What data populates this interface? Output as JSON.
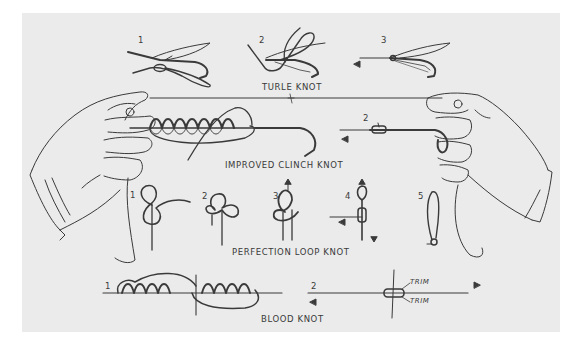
{
  "figure": {
    "colors": {
      "paper": "#ebebeb",
      "ink": "#3a3a3a",
      "border": "#ffffff"
    }
  },
  "sections": {
    "turle": {
      "label": "TURLE KNOT",
      "steps": [
        "1",
        "2",
        "3"
      ]
    },
    "clinch": {
      "label": "IMPROVED CLINCH KNOT",
      "steps": [
        "1",
        "2"
      ]
    },
    "perfection": {
      "label": "PERFECTION LOOP KNOT",
      "steps": [
        "1",
        "2",
        "3",
        "4",
        "5"
      ]
    },
    "blood": {
      "label": "BLOOD KNOT",
      "steps": [
        "1",
        "2"
      ],
      "annotations": [
        "TRIM",
        "TRIM"
      ]
    }
  },
  "icons": [
    "left-hand-illustration",
    "right-hand-illustration",
    "arrow-left-icon",
    "arrow-right-icon",
    "arrow-up-icon",
    "arrow-down-icon",
    "fishing-fly-illustration",
    "fish-hook-illustration"
  ]
}
